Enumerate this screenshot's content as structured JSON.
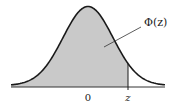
{
  "diagram": {
    "curve": "standard normal density",
    "colors": {
      "shade": "#c9c9c9",
      "curve": "#1a1a1a",
      "axis": "#333333",
      "background": "#ffffff"
    },
    "labels": {
      "area": "Φ(z)",
      "origin": "0",
      "z": "z"
    },
    "geometry": {
      "baseline_y": 87,
      "x_start": 11,
      "x_end": 165,
      "mean_x": 88,
      "z_x": 128,
      "peak_y": 8,
      "sigma_px": 25
    }
  }
}
